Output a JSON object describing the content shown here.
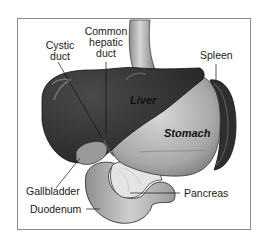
{
  "diagram": {
    "type": "anatomical-illustration",
    "frame_color": "#8a8a8a",
    "colors": {
      "liver": "#3a3a3a",
      "stomach": "#b0b0b0",
      "spleen": "#2e2e2e",
      "duodenum": "#c4c4c4",
      "pancreas": "#e6e6e6",
      "gallbladder": "#9a9a9a",
      "esophagus": "#bdbdbd"
    },
    "organ_labels": {
      "liver": "Liver",
      "stomach": "Stomach"
    },
    "callouts": {
      "cystic_duct": [
        "Cystic",
        "duct"
      ],
      "common_hepatic_duct": [
        "Common",
        "hepatic",
        "duct"
      ],
      "spleen": "Spleen",
      "gallbladder": "Gallbladder",
      "duodenum": "Duodenum",
      "pancreas": "Pancreas"
    }
  }
}
